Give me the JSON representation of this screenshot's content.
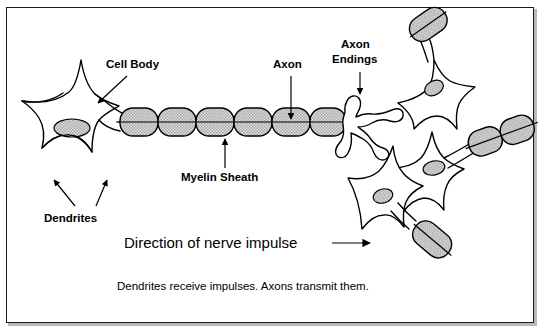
{
  "figure": {
    "type": "biology-diagram",
    "background_color": "#ffffff",
    "border_color": "#1a1a1a",
    "myelin_fill_color": "#c8c8c8",
    "cell_fill_color": "#ffffff",
    "line_color": "#000000"
  },
  "labels": {
    "cell_body": "Cell Body",
    "axon": "Axon",
    "axon_endings_line1": "Axon",
    "axon_endings_line2": "Endings",
    "myelin_sheath": "Myelin Sheath",
    "dendrites": "Dendrites"
  },
  "annotations": {
    "direction": "Direction of nerve impulse",
    "caption": "Dendrites receive impulses. Axons transmit them."
  },
  "structure": {
    "myelin_segment_count": 6,
    "axon_terminal_branch_count": 4,
    "receiving_neuron_count": 3,
    "dendrite_arrow_count": 2
  }
}
